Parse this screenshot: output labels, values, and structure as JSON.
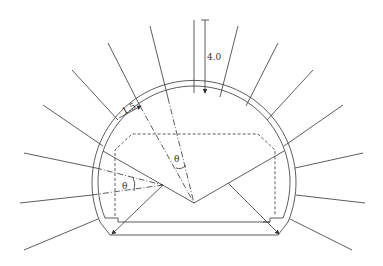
{
  "diagram": {
    "type": "tunnel cross-section with radial rock bolts",
    "colors": {
      "line": "#333333",
      "background": "#ffffff"
    },
    "labels": {
      "bolt_length": "4.0",
      "spacing": "1.5",
      "angle_crown": "θ",
      "angle_side": "θ"
    },
    "elements": [
      "outer lining arch",
      "inner lining arch",
      "radial rock bolts (16)",
      "dashed clearance envelope",
      "invert floor",
      "dimension arrow 4.0",
      "dimension arrow 1.5",
      "angle θ at crown",
      "angle θ at side wall"
    ]
  }
}
